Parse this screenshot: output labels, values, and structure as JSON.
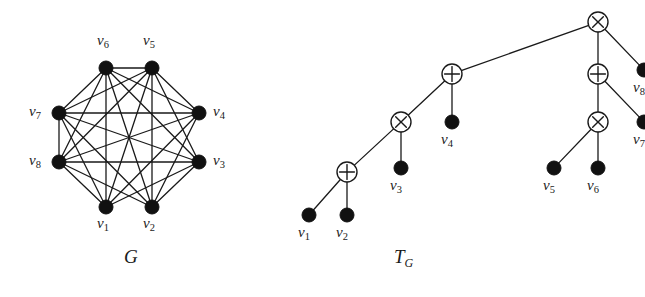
{
  "figure": {
    "background_color": "#ffffff",
    "ink_color": "#1a1a1a",
    "node_fill_color": "#111111",
    "operator_fill_color": "#ffffff"
  },
  "graph_panel": {
    "caption": "G",
    "caption_name": "graph-caption",
    "description": "Octagonal layout of 8 labelled vertices with straight-line edges",
    "vertices": [
      {
        "id": "v1",
        "label": "v",
        "sub": "1",
        "x": 106,
        "y": 207,
        "label_x": 97,
        "label_y": 216
      },
      {
        "id": "v2",
        "label": "v",
        "sub": "2",
        "x": 152,
        "y": 207,
        "label_x": 143,
        "label_y": 216
      },
      {
        "id": "v3",
        "label": "v",
        "sub": "3",
        "x": 199,
        "y": 162,
        "label_x": 213,
        "label_y": 153
      },
      {
        "id": "v4",
        "label": "v",
        "sub": "4",
        "x": 199,
        "y": 113,
        "label_x": 213,
        "label_y": 104
      },
      {
        "id": "v5",
        "label": "v",
        "sub": "5",
        "x": 152,
        "y": 68,
        "label_x": 143,
        "label_y": 33
      },
      {
        "id": "v6",
        "label": "v",
        "sub": "6",
        "x": 106,
        "y": 68,
        "label_x": 97,
        "label_y": 33
      },
      {
        "id": "v7",
        "label": "v",
        "sub": "7",
        "x": 59,
        "y": 113,
        "label_x": 29,
        "label_y": 104
      },
      {
        "id": "v8",
        "label": "v",
        "sub": "8",
        "x": 59,
        "y": 162,
        "label_x": 29,
        "label_y": 153
      }
    ],
    "vertex_radius": 7,
    "edges": [
      [
        "v1",
        "v3"
      ],
      [
        "v1",
        "v4"
      ],
      [
        "v1",
        "v5"
      ],
      [
        "v1",
        "v6"
      ],
      [
        "v1",
        "v7"
      ],
      [
        "v1",
        "v8"
      ],
      [
        "v2",
        "v3"
      ],
      [
        "v2",
        "v4"
      ],
      [
        "v2",
        "v5"
      ],
      [
        "v2",
        "v6"
      ],
      [
        "v2",
        "v7"
      ],
      [
        "v2",
        "v8"
      ],
      [
        "v3",
        "v5"
      ],
      [
        "v3",
        "v6"
      ],
      [
        "v3",
        "v7"
      ],
      [
        "v3",
        "v8"
      ],
      [
        "v4",
        "v5"
      ],
      [
        "v4",
        "v6"
      ],
      [
        "v4",
        "v7"
      ],
      [
        "v4",
        "v8"
      ],
      [
        "v5",
        "v6"
      ],
      [
        "v5",
        "v7"
      ],
      [
        "v5",
        "v8"
      ],
      [
        "v6",
        "v7"
      ],
      [
        "v6",
        "v8"
      ],
      [
        "v7",
        "v8"
      ]
    ],
    "missing_edges": [
      [
        "v1",
        "v2"
      ],
      [
        "v3",
        "v4"
      ]
    ],
    "edge_count": 26
  },
  "tree_panel": {
    "caption": "T",
    "caption_sub": "G",
    "caption_name": "tree-caption",
    "description": "Cotree of G with circled-times and circled-plus internal operator nodes and filled leaves",
    "operator_radius": 10,
    "leaf_radius": 7,
    "nodes": [
      {
        "id": "n0",
        "type": "otimes",
        "glyph": "circled-times",
        "x": 314,
        "y": 22,
        "label": null
      },
      {
        "id": "n1",
        "type": "oplus",
        "glyph": "circled-plus",
        "x": 168,
        "y": 74,
        "label": null
      },
      {
        "id": "n2",
        "type": "oplus",
        "glyph": "circled-plus",
        "x": 314,
        "y": 74,
        "label": null
      },
      {
        "id": "n3",
        "type": "otimes",
        "glyph": "circled-times",
        "x": 117,
        "y": 122,
        "label": null
      },
      {
        "id": "n4",
        "type": "otimes",
        "glyph": "circled-times",
        "x": 314,
        "y": 122,
        "label": null
      },
      {
        "id": "n5",
        "type": "oplus",
        "glyph": "circled-plus",
        "x": 63,
        "y": 172,
        "label": null
      },
      {
        "id": "v1",
        "type": "leaf",
        "glyph": "filled-disc",
        "x": 25,
        "y": 215,
        "label": "v",
        "sub": "1",
        "label_x": 14,
        "label_y": 225
      },
      {
        "id": "v2",
        "type": "leaf",
        "glyph": "filled-disc",
        "x": 63,
        "y": 215,
        "label": "v",
        "sub": "2",
        "label_x": 52,
        "label_y": 225
      },
      {
        "id": "v3",
        "type": "leaf",
        "glyph": "filled-disc",
        "x": 117,
        "y": 168,
        "label": "v",
        "sub": "3",
        "label_x": 106,
        "label_y": 178
      },
      {
        "id": "v4",
        "type": "leaf",
        "glyph": "filled-disc",
        "x": 168,
        "y": 122,
        "label": "v",
        "sub": "4",
        "label_x": 157,
        "label_y": 132
      },
      {
        "id": "v5",
        "type": "leaf",
        "glyph": "filled-disc",
        "x": 270,
        "y": 168,
        "label": "v",
        "sub": "5",
        "label_x": 259,
        "label_y": 178
      },
      {
        "id": "v6",
        "type": "leaf",
        "glyph": "filled-disc",
        "x": 314,
        "y": 168,
        "label": "v",
        "sub": "6",
        "label_x": 303,
        "label_y": 178
      },
      {
        "id": "v7",
        "type": "leaf",
        "glyph": "filled-disc",
        "x": 360,
        "y": 122,
        "label": "v",
        "sub": "7",
        "label_x": 349,
        "label_y": 132
      },
      {
        "id": "v8",
        "type": "leaf",
        "glyph": "filled-disc",
        "x": 360,
        "y": 70,
        "label": "v",
        "sub": "8",
        "label_x": 349,
        "label_y": 80
      }
    ],
    "edges": [
      [
        "n0",
        "n1"
      ],
      [
        "n0",
        "n2"
      ],
      [
        "n0",
        "v8"
      ],
      [
        "n1",
        "n3"
      ],
      [
        "n1",
        "v4"
      ],
      [
        "n2",
        "n4"
      ],
      [
        "n2",
        "v7"
      ],
      [
        "n3",
        "n5"
      ],
      [
        "n3",
        "v3"
      ],
      [
        "n4",
        "v5"
      ],
      [
        "n4",
        "v6"
      ],
      [
        "n5",
        "v1"
      ],
      [
        "n5",
        "v2"
      ]
    ]
  }
}
